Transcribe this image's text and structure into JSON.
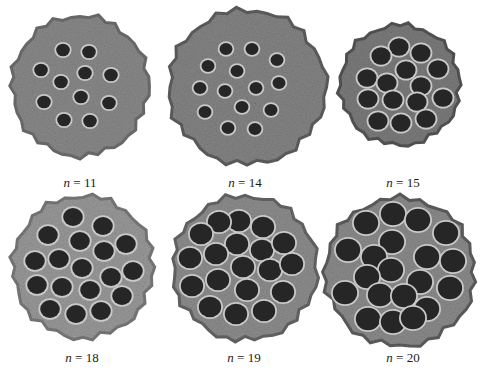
{
  "figure": {
    "panels": [
      {
        "id": "pod-1",
        "label_var": "n",
        "label_eq": " = ",
        "label_value": "11",
        "cx": 80,
        "cy": 86,
        "rx": 68,
        "ry": 70,
        "body": "#8a8a8a",
        "rim": "#6e6e6e",
        "holeRatio": 0.1,
        "label_x": 80,
        "label_y": 176,
        "holes": [
          [
            63,
            50
          ],
          [
            89,
            52
          ],
          [
            41,
            70
          ],
          [
            85,
            73
          ],
          [
            111,
            75
          ],
          [
            61,
            82
          ],
          [
            81,
            97
          ],
          [
            44,
            102
          ],
          [
            109,
            103
          ],
          [
            64,
            120
          ],
          [
            90,
            121
          ]
        ]
      },
      {
        "id": "pod-2",
        "label_var": "n",
        "label_eq": " = ",
        "label_value": "14",
        "cx": 247,
        "cy": 87,
        "rx": 78,
        "ry": 77,
        "body": "#858585",
        "rim": "#5f5f5f",
        "holeRatio": 0.085,
        "label_x": 245,
        "label_y": 176,
        "holes": [
          [
            226,
            49
          ],
          [
            252,
            49
          ],
          [
            277,
            60
          ],
          [
            208,
            66
          ],
          [
            237,
            71
          ],
          [
            279,
            83
          ],
          [
            200,
            88
          ],
          [
            225,
            91
          ],
          [
            256,
            88
          ],
          [
            205,
            112
          ],
          [
            242,
            107
          ],
          [
            271,
            110
          ],
          [
            228,
            128
          ],
          [
            255,
            129
          ]
        ]
      },
      {
        "id": "pod-3",
        "label_var": "n",
        "label_eq": " = ",
        "label_value": "15",
        "cx": 400,
        "cy": 85,
        "rx": 60,
        "ry": 60,
        "body": "#7c7c7c",
        "rim": "#555555",
        "holeRatio": 0.16,
        "label_x": 403,
        "label_y": 176,
        "holes": [
          [
            399,
            47
          ],
          [
            421,
            53
          ],
          [
            381,
            56
          ],
          [
            438,
            69
          ],
          [
            367,
            78
          ],
          [
            406,
            70
          ],
          [
            387,
            83
          ],
          [
            421,
            86
          ],
          [
            443,
            98
          ],
          [
            368,
            99
          ],
          [
            393,
            100
          ],
          [
            417,
            102
          ],
          [
            378,
            121
          ],
          [
            401,
            123
          ],
          [
            426,
            119
          ]
        ]
      },
      {
        "id": "pod-4",
        "label_var": "n",
        "label_eq": " = ",
        "label_value": "18",
        "cx": 83,
        "cy": 267,
        "rx": 70,
        "ry": 71,
        "body": "#9a9a9a",
        "rim": "#7a7a7a",
        "holeRatio": 0.14,
        "label_x": 82,
        "label_y": 351,
        "holes": [
          [
            73,
            217
          ],
          [
            103,
            226
          ],
          [
            48,
            235
          ],
          [
            80,
            241
          ],
          [
            126,
            244
          ],
          [
            35,
            261
          ],
          [
            59,
            259
          ],
          [
            104,
            251
          ],
          [
            82,
            268
          ],
          [
            133,
            271
          ],
          [
            111,
            277
          ],
          [
            37,
            285
          ],
          [
            62,
            287
          ],
          [
            90,
            290
          ],
          [
            122,
            296
          ],
          [
            50,
            309
          ],
          [
            76,
            314
          ],
          [
            101,
            311
          ]
        ]
      },
      {
        "id": "pod-5",
        "label_var": "n",
        "label_eq": " = ",
        "label_value": "19",
        "cx": 245,
        "cy": 268,
        "rx": 72,
        "ry": 72,
        "body": "#8e8e8e",
        "rim": "#666666",
        "holeRatio": 0.155,
        "label_x": 244,
        "label_y": 351,
        "holes": [
          [
            239,
            221
          ],
          [
            263,
            227
          ],
          [
            219,
            222
          ],
          [
            201,
            234
          ],
          [
            237,
            244
          ],
          [
            262,
            250
          ],
          [
            284,
            243
          ],
          [
            190,
            258
          ],
          [
            216,
            254
          ],
          [
            243,
            267
          ],
          [
            270,
            270
          ],
          [
            292,
            264
          ],
          [
            192,
            286
          ],
          [
            218,
            280
          ],
          [
            247,
            290
          ],
          [
            283,
            292
          ],
          [
            210,
            307
          ],
          [
            236,
            314
          ],
          [
            264,
            311
          ]
        ]
      },
      {
        "id": "pod-6",
        "label_var": "n",
        "label_eq": " = ",
        "label_value": "20",
        "cx": 400,
        "cy": 272,
        "rx": 75,
        "ry": 74,
        "body": "#8c8c8c",
        "rim": "#5e5e5e",
        "holeRatio": 0.165,
        "label_x": 403,
        "label_y": 351,
        "holes": [
          [
            393,
            214
          ],
          [
            366,
            223
          ],
          [
            418,
            220
          ],
          [
            446,
            233
          ],
          [
            348,
            250
          ],
          [
            392,
            242
          ],
          [
            427,
            257
          ],
          [
            453,
            261
          ],
          [
            374,
            257
          ],
          [
            391,
            270
          ],
          [
            367,
            277
          ],
          [
            420,
            282
          ],
          [
            450,
            288
          ],
          [
            345,
            293
          ],
          [
            380,
            295
          ],
          [
            404,
            296
          ],
          [
            368,
            319
          ],
          [
            393,
            322
          ],
          [
            427,
            309
          ],
          [
            413,
            318
          ]
        ]
      }
    ]
  }
}
